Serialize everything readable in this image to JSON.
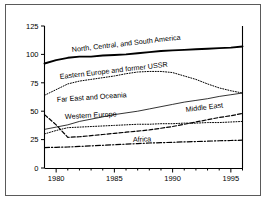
{
  "chart_data": {
    "type": "line",
    "title": "",
    "xlabel": "",
    "ylabel": "Quadrillion Btu",
    "xlim": [
      1979,
      1996
    ],
    "ylim": [
      0,
      125
    ],
    "grid": false,
    "legend": "inline-labels",
    "ytick_labels": [
      "0",
      "25",
      "50",
      "75",
      "100",
      "125"
    ],
    "ytick_values": [
      0,
      25,
      50,
      75,
      100,
      125
    ],
    "xtick_labels": [
      "1980",
      "1985",
      "1990",
      "1995"
    ],
    "xtick_values": [
      1980,
      1985,
      1990,
      1995
    ],
    "x": [
      1979,
      1980,
      1981,
      1982,
      1983,
      1984,
      1985,
      1986,
      1987,
      1988,
      1989,
      1990,
      1991,
      1992,
      1993,
      1994,
      1995,
      1996
    ],
    "series": [
      {
        "name": "North, Central, and South America",
        "label": "North, Central, and South America",
        "style": "solid-thick",
        "values": [
          92,
          95,
          97,
          98,
          98,
          99,
          99.5,
          100,
          101,
          102,
          103,
          103.5,
          104,
          104.5,
          105,
          105.5,
          106,
          107
        ]
      },
      {
        "name": "Eastern Europe and former USSR",
        "label": "Eastern Europe and former USSR",
        "style": "dotted",
        "values": [
          64,
          69,
          74,
          76.5,
          78,
          79.5,
          81,
          83,
          84.5,
          85,
          85,
          84,
          81,
          78,
          74,
          70.5,
          68,
          66
        ]
      },
      {
        "name": "Far East and Oceania",
        "label": "Far East and Oceania",
        "style": "solid-thin",
        "values": [
          34,
          36,
          38,
          41,
          43,
          45,
          47,
          48.5,
          50,
          52,
          54,
          56,
          58,
          59.5,
          61,
          63,
          64.5,
          66
        ]
      },
      {
        "name": "Western Europe",
        "label": "Western Europe",
        "style": "dotted",
        "values": [
          30,
          33,
          35.5,
          36,
          36.5,
          37,
          37.5,
          38,
          38.5,
          38.5,
          39,
          39,
          39.5,
          39.5,
          40,
          40,
          40.5,
          41
        ]
      },
      {
        "name": "Middle East",
        "label": "Middle East",
        "style": "dashed",
        "values": [
          47,
          38,
          27,
          27.5,
          28.5,
          29.5,
          30.5,
          31.5,
          32.5,
          33.5,
          35,
          36.5,
          38.5,
          40.5,
          42.5,
          44.5,
          46,
          48
        ]
      },
      {
        "name": "Africa",
        "label": "Africa",
        "style": "dash-dot",
        "values": [
          18,
          18.2,
          18.5,
          19,
          19.5,
          20,
          20.5,
          21,
          21.5,
          22,
          22.3,
          22.6,
          23,
          23.3,
          23.6,
          24,
          24.2,
          24.5
        ]
      }
    ]
  },
  "colors": {
    "frame": "#5a5a5a",
    "axis": "#000000",
    "series_line": "#000000"
  }
}
